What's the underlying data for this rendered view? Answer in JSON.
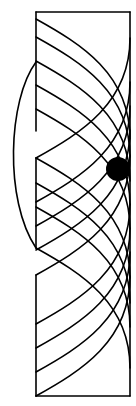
{
  "diagram": {
    "colors": {
      "line": "#000000",
      "background": "#ffffff",
      "dot": "#000000"
    },
    "rectangle": {
      "x": 36,
      "y": 12,
      "width": 94,
      "height": 384
    },
    "left_edge_segments": [
      [
        12,
        131
      ],
      [
        158,
        248
      ],
      [
        275,
        396
      ]
    ],
    "outer_arc": {
      "from": [
        36,
        62
      ],
      "to": [
        36,
        248
      ],
      "bulge_x": 12
    },
    "dot": {
      "cx": 118,
      "cy": 169,
      "r": 12
    },
    "descending_curves_start_y": [
      19,
      37,
      61,
      85,
      109,
      158,
      183,
      207,
      248
    ],
    "ascending_curves_end_y": [
      396,
      372,
      348,
      324,
      275,
      250,
      226,
      202,
      158
    ]
  }
}
